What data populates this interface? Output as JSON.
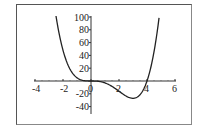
{
  "chart_data": {
    "type": "line",
    "title": "",
    "xlabel": "",
    "ylabel": "",
    "function": "x^4 - 4x^3",
    "xlim": [
      -4,
      6
    ],
    "ylim": [
      -50,
      100
    ],
    "x_ticks": [
      -4,
      -2,
      0,
      2,
      4,
      6
    ],
    "x_tick_labels": [
      "-4",
      "-2",
      "0",
      "2",
      "4",
      "6"
    ],
    "y_ticks": [
      -40,
      -20,
      20,
      40,
      60,
      80,
      100
    ],
    "y_tick_labels": [
      "-40",
      "-20",
      "20",
      "40",
      "60",
      "80",
      "100"
    ],
    "grid": false,
    "legend": null,
    "series": [
      {
        "name": "f(x)",
        "color": "#222222",
        "x": [
          -2.5,
          -2.0,
          -1.5,
          -1.0,
          -0.5,
          0,
          0.5,
          1.0,
          1.5,
          2.0,
          2.5,
          3.0,
          3.5,
          4.0,
          4.5,
          4.86
        ],
        "y": [
          101.6,
          48,
          18.6,
          5,
          0.6,
          0,
          -0.4,
          -3,
          -8.4,
          -16,
          -23.4,
          -27,
          -21.4,
          0,
          45.6,
          100
        ]
      }
    ],
    "key_points": {
      "roots": [
        0,
        4
      ],
      "minimum": {
        "x": 3,
        "y": -27
      }
    }
  }
}
